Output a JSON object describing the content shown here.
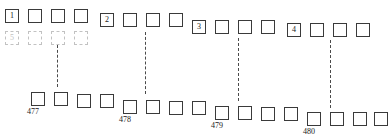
{
  "diagram": {
    "colors": {
      "square_stroke": "#3a3a3a",
      "ghost_stroke": "#c2c2c2",
      "separator": "#4a4a4a",
      "text": "#1a1a1a",
      "background": "#ffffff"
    },
    "top_row": {
      "name": "top-block-row",
      "squares": [
        {
          "x": 5,
          "y": 9,
          "label": "1",
          "ghost": false
        },
        {
          "x": 28,
          "y": 9,
          "label": "",
          "ghost": false
        },
        {
          "x": 51,
          "y": 9,
          "label": "",
          "ghost": false
        },
        {
          "x": 74,
          "y": 9,
          "label": "",
          "ghost": false
        },
        {
          "x": 100,
          "y": 13,
          "label": "2",
          "ghost": false
        },
        {
          "x": 123,
          "y": 13,
          "label": "",
          "ghost": false
        },
        {
          "x": 146,
          "y": 13,
          "label": "",
          "ghost": false
        },
        {
          "x": 169,
          "y": 13,
          "label": "",
          "ghost": false
        },
        {
          "x": 192,
          "y": 20,
          "label": "3",
          "ghost": false
        },
        {
          "x": 215,
          "y": 20,
          "label": "",
          "ghost": false
        },
        {
          "x": 238,
          "y": 20,
          "label": "",
          "ghost": false
        },
        {
          "x": 261,
          "y": 20,
          "label": "",
          "ghost": false
        },
        {
          "x": 287,
          "y": 23,
          "label": "4",
          "ghost": false
        },
        {
          "x": 310,
          "y": 23,
          "label": "",
          "ghost": false
        },
        {
          "x": 333,
          "y": 23,
          "label": "",
          "ghost": false
        },
        {
          "x": 356,
          "y": 23,
          "label": "",
          "ghost": false
        }
      ]
    },
    "ghost_row": {
      "name": "ghost-block-row",
      "squares": [
        {
          "x": 5,
          "y": 31,
          "label": "5",
          "ghost": true
        },
        {
          "x": 28,
          "y": 31,
          "label": "",
          "ghost": true
        },
        {
          "x": 51,
          "y": 31,
          "label": "",
          "ghost": true
        },
        {
          "x": 74,
          "y": 31,
          "label": "",
          "ghost": true
        }
      ]
    },
    "bottom_row": {
      "name": "bottom-block-row",
      "squares": [
        {
          "x": 31,
          "y": 92,
          "caption": "477"
        },
        {
          "x": 54,
          "y": 92,
          "caption": ""
        },
        {
          "x": 77,
          "y": 94,
          "caption": ""
        },
        {
          "x": 100,
          "y": 94,
          "caption": ""
        },
        {
          "x": 123,
          "y": 100,
          "caption": "478"
        },
        {
          "x": 146,
          "y": 100,
          "caption": ""
        },
        {
          "x": 169,
          "y": 101,
          "caption": ""
        },
        {
          "x": 192,
          "y": 101,
          "caption": ""
        },
        {
          "x": 215,
          "y": 106,
          "caption": "479"
        },
        {
          "x": 238,
          "y": 106,
          "caption": ""
        },
        {
          "x": 261,
          "y": 107,
          "caption": ""
        },
        {
          "x": 284,
          "y": 107,
          "caption": ""
        },
        {
          "x": 307,
          "y": 112,
          "caption": "480"
        },
        {
          "x": 330,
          "y": 112,
          "caption": ""
        },
        {
          "x": 353,
          "y": 112,
          "caption": ""
        },
        {
          "x": 374,
          "y": 112,
          "caption": ""
        }
      ]
    },
    "separators": [
      {
        "name": "separator-1",
        "x": 57,
        "y": 45,
        "height": 42
      },
      {
        "name": "separator-2",
        "x": 145,
        "y": 32,
        "height": 62
      },
      {
        "name": "separator-3",
        "x": 238,
        "y": 38,
        "height": 63
      },
      {
        "name": "separator-4",
        "x": 330,
        "y": 40,
        "height": 68
      }
    ]
  }
}
